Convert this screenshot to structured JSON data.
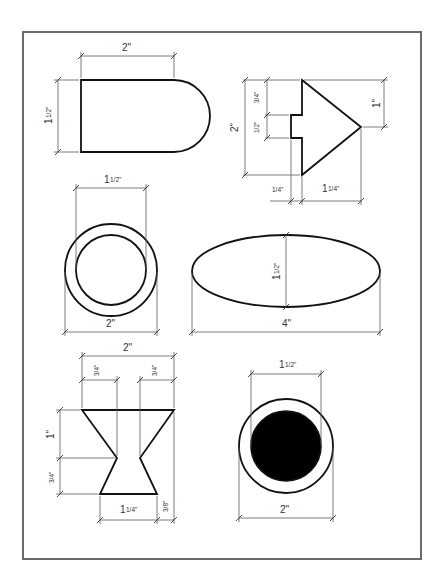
{
  "sheet": {
    "title": "Dimensioned geometric shapes",
    "frame": {
      "x": 23,
      "y": 32,
      "w": 398,
      "h": 527,
      "color": "#6b6b6b"
    }
  },
  "shapes": [
    {
      "id": "rounded-rectangle",
      "description": "Rectangle with semicircular right end",
      "dimensions": [
        {
          "label": "2\"",
          "whole": "2",
          "frac": "",
          "orientation": "horizontal",
          "measures": "width of straight section"
        },
        {
          "label": "1 1/2\"",
          "whole": "1",
          "frac": "1/2",
          "orientation": "vertical",
          "measures": "height"
        }
      ]
    },
    {
      "id": "notched-arrow",
      "description": "Triangular arrow with rectangular notch on back edge",
      "dimensions": [
        {
          "label": "3/4\"",
          "whole": "",
          "frac": "3/4",
          "orientation": "vertical",
          "measures": "top to notch"
        },
        {
          "label": "1/2\"",
          "whole": "",
          "frac": "1/2",
          "orientation": "vertical",
          "measures": "notch height"
        },
        {
          "label": "2\"",
          "whole": "2",
          "frac": "",
          "orientation": "vertical",
          "measures": "total height"
        },
        {
          "label": "1\"",
          "whole": "1",
          "frac": "",
          "orientation": "vertical",
          "measures": "top to tip"
        },
        {
          "label": "1/4\"",
          "whole": "",
          "frac": "1/4",
          "orientation": "horizontal",
          "measures": "notch depth"
        },
        {
          "label": "1 1/4\"",
          "whole": "1",
          "frac": "1/4",
          "orientation": "horizontal",
          "measures": "arrow length"
        }
      ]
    },
    {
      "id": "ring",
      "description": "Concentric circles (washer)",
      "dimensions": [
        {
          "label": "1 1/2\"",
          "whole": "1",
          "frac": "1/2",
          "orientation": "horizontal",
          "measures": "inner diameter"
        },
        {
          "label": "2\"",
          "whole": "2",
          "frac": "",
          "orientation": "horizontal",
          "measures": "outer diameter"
        }
      ]
    },
    {
      "id": "ellipse",
      "description": "Ellipse",
      "dimensions": [
        {
          "label": "1 1/2\"",
          "whole": "1",
          "frac": "1/2",
          "orientation": "vertical",
          "measures": "minor axis"
        },
        {
          "label": "4\"",
          "whole": "4",
          "frac": "",
          "orientation": "horizontal",
          "measures": "major axis"
        }
      ]
    },
    {
      "id": "hourglass",
      "description": "Hourglass / spool profile",
      "dimensions": [
        {
          "label": "2\"",
          "whole": "2",
          "frac": "",
          "orientation": "horizontal",
          "measures": "top width"
        },
        {
          "label": "3/4\"",
          "whole": "",
          "frac": "3/4",
          "orientation": "horizontal",
          "measures": "left top offset"
        },
        {
          "label": "3/4\"",
          "whole": "",
          "frac": "3/4",
          "orientation": "horizontal",
          "measures": "right top offset"
        },
        {
          "label": "1\"",
          "whole": "1",
          "frac": "",
          "orientation": "vertical",
          "measures": "upper height"
        },
        {
          "label": "3/4\"",
          "whole": "",
          "frac": "3/4",
          "orientation": "vertical",
          "measures": "lower height"
        },
        {
          "label": "1 1/4\"",
          "whole": "1",
          "frac": "1/4",
          "orientation": "horizontal",
          "measures": "bottom width"
        },
        {
          "label": "3/8\"",
          "whole": "",
          "frac": "3/8",
          "orientation": "horizontal",
          "measures": "bottom right offset"
        }
      ]
    },
    {
      "id": "filled-ring",
      "description": "Circle with solid filled inner circle",
      "dimensions": [
        {
          "label": "1 1/2\"",
          "whole": "1",
          "frac": "1/2",
          "orientation": "horizontal",
          "measures": "inner diameter"
        },
        {
          "label": "2\"",
          "whole": "2",
          "frac": "",
          "orientation": "horizontal",
          "measures": "outer diameter"
        }
      ]
    }
  ],
  "labels": {
    "s1_w": "2\"",
    "s1_h_whole": "1",
    "s1_h_frac": "1/2\"",
    "s2_a": "3/4\"",
    "s2_b": "1/2\"",
    "s2_h": "2\"",
    "s2_tip": "1\"",
    "s2_notch": "1/4\"",
    "s2_len_whole": "1",
    "s2_len_frac": "1/4\"",
    "s3_in_whole": "1",
    "s3_in_frac": "1/2\"",
    "s3_out": "2\"",
    "s4_h_whole": "1",
    "s4_h_frac": "1/2\"",
    "s4_w": "4\"",
    "s5_w": "2\"",
    "s5_l": "3/4\"",
    "s5_r": "3/4\"",
    "s5_up": "1\"",
    "s5_low": "3/4\"",
    "s5_bw_whole": "1",
    "s5_bw_frac": "1/4\"",
    "s5_off": "3/8\"",
    "s6_in_whole": "1",
    "s6_in_frac": "1/2\"",
    "s6_out": "2\""
  }
}
